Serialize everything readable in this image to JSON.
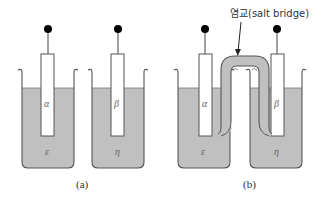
{
  "figure": {
    "panel_a": {
      "caption": "(a)",
      "left_cell": {
        "electrode_label": "α",
        "solution_label": "ε"
      },
      "right_cell": {
        "electrode_label": "β",
        "solution_label": "η"
      }
    },
    "panel_b": {
      "caption": "(b)",
      "left_cell": {
        "electrode_label": "α",
        "solution_label": "ε"
      },
      "right_cell": {
        "electrode_label": "β",
        "solution_label": "η"
      },
      "salt_bridge_label": "염교(salt bridge)"
    },
    "colors": {
      "solution_fill": "#c0c0c0",
      "outline": "#555555",
      "electrode_fill": "#ffffff",
      "terminal": "#000000"
    }
  }
}
